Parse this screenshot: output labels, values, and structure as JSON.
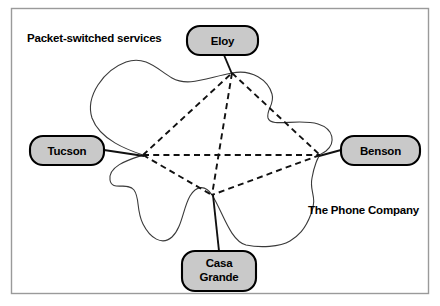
{
  "figure": {
    "title_label": "Packet-switched services",
    "cloud_label": "The Phone Company",
    "nodes": [
      {
        "id": "eloy",
        "label": "Eloy",
        "label_line1": "Eloy",
        "label_line2": ""
      },
      {
        "id": "tucson",
        "label": "Tucson",
        "label_line1": "Tucson",
        "label_line2": ""
      },
      {
        "id": "benson",
        "label": "Benson",
        "label_line1": "Benson",
        "label_line2": ""
      },
      {
        "id": "casa-grande",
        "label": "Casa Grande",
        "label_line1": "Casa",
        "label_line2": "Grande"
      }
    ],
    "links": [
      {
        "from": "tucson",
        "to": "eloy",
        "style": "dashed"
      },
      {
        "from": "tucson",
        "to": "benson",
        "style": "dashed"
      },
      {
        "from": "tucson",
        "to": "casa-grande",
        "style": "dashed"
      },
      {
        "from": "eloy",
        "to": "benson",
        "style": "dashed"
      },
      {
        "from": "eloy",
        "to": "casa-grande",
        "style": "dashed"
      },
      {
        "from": "benson",
        "to": "casa-grande",
        "style": "dashed"
      }
    ],
    "colors": {
      "node_fill": "#c9c9c9",
      "node_stroke": "#000000",
      "link": "#111111",
      "cloud_stroke": "#3a3a3a",
      "frame_stroke": "#9a9a9a",
      "background": "#ffffff"
    }
  }
}
